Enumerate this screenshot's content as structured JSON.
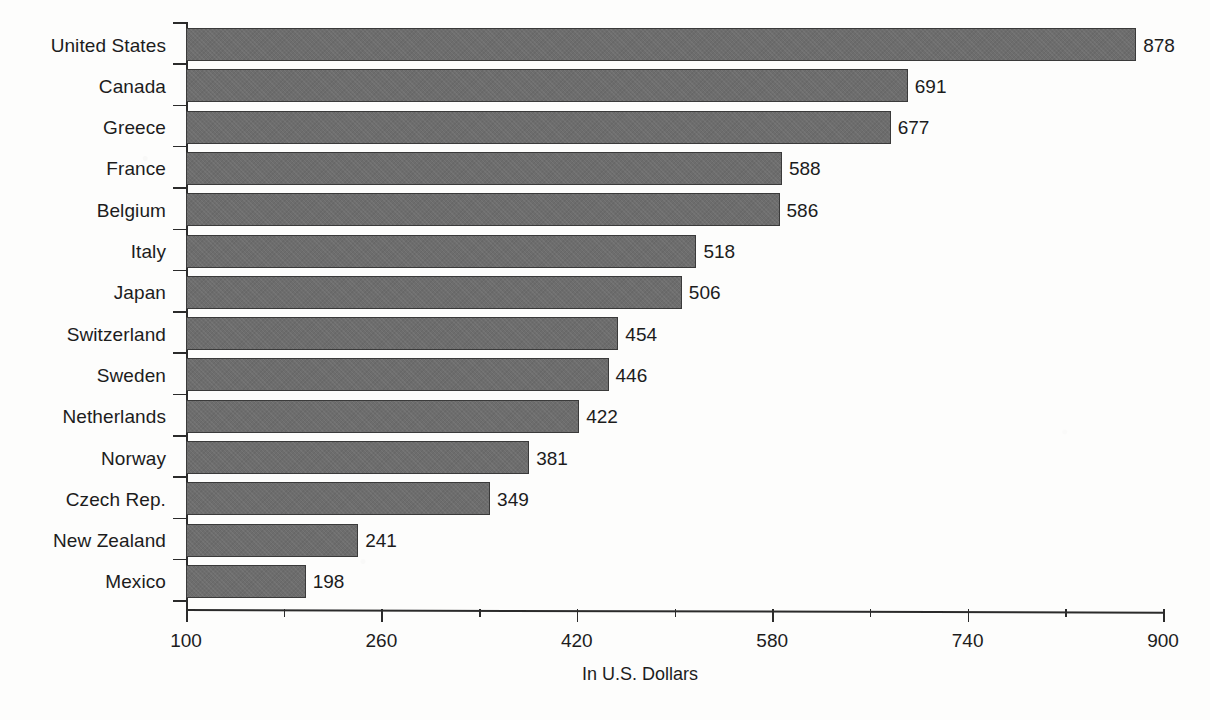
{
  "chart_data": {
    "type": "bar",
    "orientation": "horizontal",
    "title": "",
    "xlabel": "In U.S. Dollars",
    "ylabel": "",
    "xlim": [
      100,
      900
    ],
    "xticks": [
      100,
      260,
      420,
      580,
      740,
      900
    ],
    "xtick_labels": [
      "100",
      "260",
      "420",
      "580",
      "740",
      "900"
    ],
    "minor_xticks": [
      180,
      340,
      500,
      660,
      820
    ],
    "grid": false,
    "legend": null,
    "bar_color": "#6d6d6d",
    "categories": [
      "United States",
      "Canada",
      "Greece",
      "France",
      "Belgium",
      "Italy",
      "Japan",
      "Switzerland",
      "Sweden",
      "Netherlands",
      "Norway",
      "Czech Rep.",
      "New Zealand",
      "Mexico"
    ],
    "values": [
      878,
      691,
      677,
      588,
      586,
      518,
      506,
      454,
      446,
      422,
      381,
      349,
      241,
      198
    ],
    "value_labels": [
      "878",
      "691",
      "677",
      "588",
      "586",
      "518",
      "506",
      "454",
      "446",
      "422",
      "381",
      "349",
      "241",
      "198"
    ]
  }
}
